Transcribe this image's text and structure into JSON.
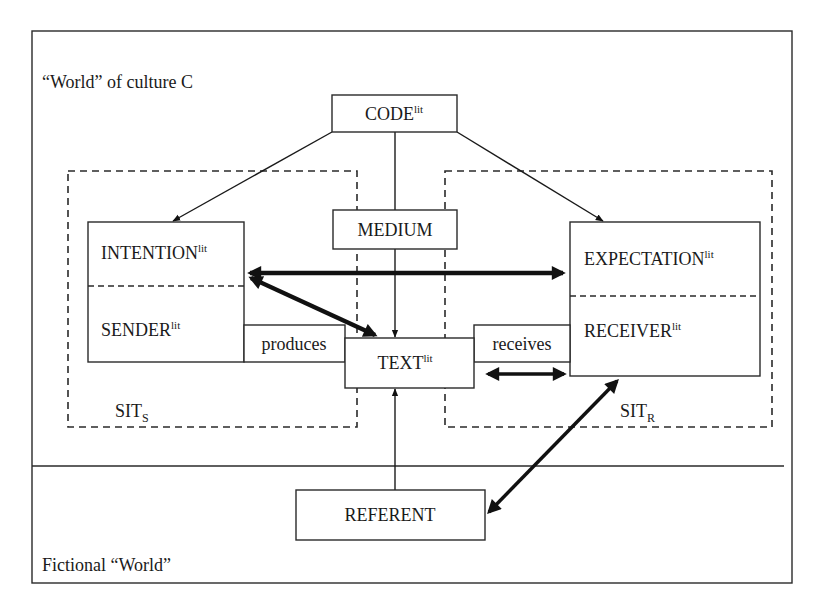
{
  "diagram": {
    "regions": {
      "culture_world": "“World” of culture C",
      "fictional_world": "Fictional “World”"
    },
    "situations": {
      "sender": {
        "base": "SIT",
        "sub": "S"
      },
      "receiver": {
        "base": "SIT",
        "sub": "R"
      }
    },
    "nodes": {
      "code": {
        "base": "CODE",
        "sup": "lit"
      },
      "medium": {
        "base": "MEDIUM"
      },
      "intention": {
        "base": "INTENTION",
        "sup": "lit"
      },
      "sender": {
        "base": "SENDER",
        "sup": "lit"
      },
      "expectation": {
        "base": "EXPECTATION",
        "sup": "lit"
      },
      "receiver": {
        "base": "RECEIVER",
        "sup": "lit"
      },
      "text": {
        "base": "TEXT",
        "sup": "lit"
      },
      "referent": {
        "base": "REFERENT"
      }
    },
    "relations": {
      "produces": "produces",
      "receives": "receives"
    },
    "edges": [
      {
        "from": "code",
        "to": "intention",
        "style": "thin-arrow"
      },
      {
        "from": "code",
        "to": "expectation",
        "style": "thin-arrow"
      },
      {
        "from": "code",
        "to": "text",
        "via": "medium",
        "style": "thin-arrow"
      },
      {
        "from": "intention",
        "to": "expectation",
        "style": "bold-double-arrow"
      },
      {
        "from": "intention",
        "to": "text",
        "style": "bold-double-arrow"
      },
      {
        "from": "text",
        "to": "receiver",
        "style": "bold-double-arrow"
      },
      {
        "from": "receiver",
        "to": "referent",
        "style": "bold-double-arrow"
      },
      {
        "from": "referent",
        "to": "text",
        "style": "thin-arrow"
      }
    ],
    "colors": {
      "ink": "#1a1a1a",
      "background": "#ffffff"
    }
  }
}
